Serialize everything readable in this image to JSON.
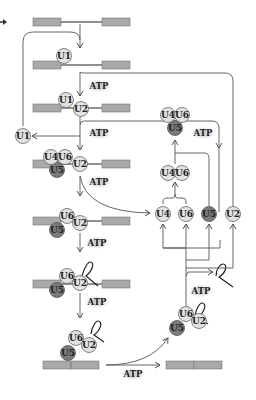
{
  "diagram": {
    "atp_label": "ATP",
    "snrnps": {
      "u1": "U1",
      "u2": "U2",
      "u4": "U4",
      "u5": "U5",
      "u6": "U6"
    },
    "colors": {
      "exon": "#a9a9a9",
      "exon_border": "#777777",
      "intron": "#222222",
      "snrnp_light": "#e2e2e2",
      "snrnp_dark": "#7a7a7a",
      "snrnp_border": "#666666",
      "arrow": "#555555",
      "atp_glow": "#c8c8c8"
    },
    "steps": [
      {
        "name": "pre-mRNA",
        "components": []
      },
      {
        "name": "E complex",
        "components": [
          "U1"
        ]
      },
      {
        "name": "A complex",
        "components": [
          "U1",
          "U2"
        ]
      },
      {
        "name": "B complex",
        "components": [
          "U4",
          "U6",
          "U5",
          "U2"
        ]
      },
      {
        "name": "activated B complex",
        "components": [
          "U6",
          "U5",
          "U2"
        ]
      },
      {
        "name": "C complex (lariat)",
        "components": [
          "U6",
          "U5",
          "U2"
        ]
      },
      {
        "name": "post-splicing complex",
        "components": [
          "U6",
          "U5",
          "U2"
        ]
      },
      {
        "name": "spliced mRNA",
        "components": []
      }
    ],
    "recycling": {
      "free_snrnps": [
        "U4",
        "U6",
        "U5",
        "U2"
      ],
      "di_snrnp": [
        "U4",
        "U6"
      ],
      "tri_snrnp": [
        "U4",
        "U6",
        "U5"
      ],
      "released": [
        "U1"
      ]
    }
  }
}
